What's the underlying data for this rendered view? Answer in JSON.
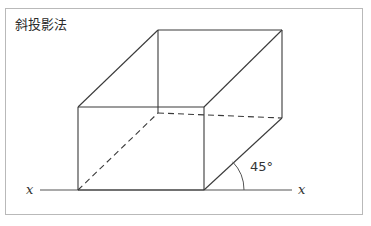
{
  "figure": {
    "title": "斜投影法",
    "border_color": "#b9b9b9",
    "background": "#ffffff",
    "line_color": "#3a3a3a",
    "axis_color": "#555555"
  },
  "axis": {
    "left_label": "x",
    "right_label": "x",
    "y": 190,
    "x_start": 40,
    "x_end": 292
  },
  "angle": {
    "label": "45°",
    "value": 45,
    "unit": "degrees",
    "vertex_x": 204,
    "vertex_y": 190,
    "arc_radius": 40
  },
  "solid": {
    "type": "oblique-projection-box",
    "front_face": {
      "top_left": [
        78,
        107
      ],
      "top_right": [
        204,
        107
      ],
      "bottom_right": [
        204,
        190
      ],
      "bottom_left": [
        78,
        190
      ]
    },
    "back_face": {
      "top_left": [
        158,
        30
      ],
      "top_right": [
        282,
        30
      ],
      "bottom_right": [
        282,
        118
      ],
      "bottom_left": [
        158,
        113
      ]
    },
    "hidden_edges": [
      "back-bottom-left-to-back-bottom-right",
      "front-bottom-left-to-back-bottom-left"
    ],
    "depth_direction_degrees": 45
  }
}
